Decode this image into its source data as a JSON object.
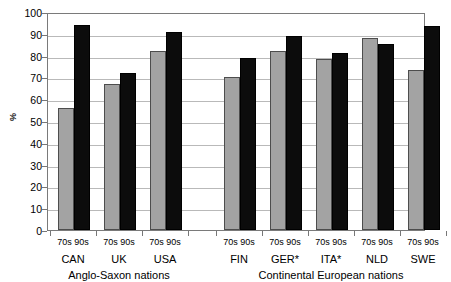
{
  "chart_data": {
    "type": "bar",
    "title": "",
    "subtitle": "",
    "xlabel": "",
    "ylabel": "%",
    "ylim": [
      0,
      100
    ],
    "ytick_labels": [
      "100",
      "90",
      "80",
      "70",
      "60",
      "50",
      "40",
      "30",
      "20",
      "10",
      "0"
    ],
    "ytick_values": [
      100,
      90,
      80,
      70,
      60,
      50,
      40,
      30,
      20,
      10,
      0
    ],
    "grid": true,
    "legend_position": "none",
    "categories": [
      "CAN",
      "UK",
      "USA",
      "FIN",
      "GER*",
      "ITA*",
      "NLD",
      "SWE"
    ],
    "series": [
      {
        "name": "70s",
        "color": "#a3a3a3",
        "values": [
          56,
          67,
          82,
          70,
          82,
          78.5,
          88,
          73.5
        ]
      },
      {
        "name": "90s",
        "color": "#0c0c0c",
        "values": [
          94,
          72,
          91,
          79,
          89,
          81,
          85.5,
          93.5
        ]
      }
    ],
    "groups": [
      {
        "label": "Anglo-Saxon nations",
        "categories": [
          "CAN",
          "UK",
          "USA"
        ]
      },
      {
        "label": "Continental European nations",
        "categories": [
          "FIN",
          "GER*",
          "ITA*",
          "NLD",
          "SWE"
        ]
      }
    ],
    "era_pair_label": "70s 90s"
  },
  "axis": {
    "y_title": "%"
  }
}
